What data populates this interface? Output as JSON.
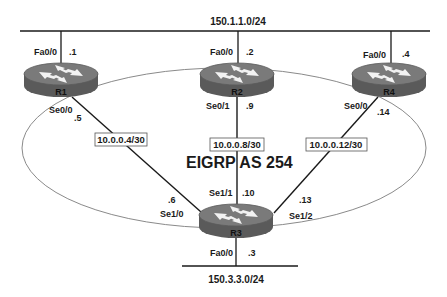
{
  "diagram": {
    "title": "EIGRP AS 254",
    "colors": {
      "router_body": "#6a6a6a",
      "router_top": "#7d7d7d",
      "router_side": "#555555",
      "line": "#1a1a1a",
      "ellipse": "#8a8a8a"
    },
    "networks": {
      "top_lan": "150.1.1.0/24",
      "bottom_lan": "150.3.3.0/24"
    },
    "subnets": {
      "r1_r3": "10.0.0.4/30",
      "r2_r3": "10.0.0.8/30",
      "r4_r3": "10.0.0.12/30"
    },
    "routers": {
      "r1": {
        "name": "R1",
        "fa_if": "Fa0/0",
        "fa_ip": ".1",
        "se_if": "Se0/0",
        "se_ip": ".5"
      },
      "r2": {
        "name": "R2",
        "fa_if": "Fa0/0",
        "fa_ip": ".2",
        "se_if": "Se0/1",
        "se_ip": ".9"
      },
      "r4": {
        "name": "R4",
        "fa_if": "Fa0/0",
        "fa_ip": ".4",
        "se_if": "Se0/0",
        "se_ip": ".14"
      },
      "r3": {
        "name": "R3",
        "fa_if": "Fa0/0",
        "fa_ip": ".3",
        "se_r1_if": "Se1/0",
        "se_r1_ip": ".6",
        "se_r2_if": "Se1/1",
        "se_r2_ip": ".10",
        "se_r4_if": "Se1/2",
        "se_r4_ip": ".13"
      }
    }
  }
}
